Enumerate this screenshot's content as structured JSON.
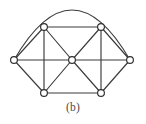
{
  "figure": {
    "caption": "(b)",
    "type": "undirected-graph-diagram",
    "canvas": {
      "width": 146,
      "height": 124
    },
    "colors": {
      "background": "#ffffff",
      "edge_stroke": "#3b3b3b",
      "vertex_stroke": "#2e2e2e",
      "vertex_fill": "#ffffff",
      "caption_text": "#4a4a4a"
    },
    "style": {
      "edge_stroke_width": 1.15,
      "vertex_radius": 3.4
    },
    "vertices": [
      {
        "id": "v-left",
        "label": "",
        "x": 14,
        "y": 60
      },
      {
        "id": "v-top-left",
        "label": "",
        "x": 44,
        "y": 27
      },
      {
        "id": "v-top-right",
        "label": "",
        "x": 101,
        "y": 27
      },
      {
        "id": "v-right",
        "label": "",
        "x": 130,
        "y": 60
      },
      {
        "id": "v-bottom-left",
        "label": "",
        "x": 44,
        "y": 93
      },
      {
        "id": "v-bottom-right",
        "label": "",
        "x": 101,
        "y": 93
      },
      {
        "id": "v-center",
        "label": "",
        "x": 72,
        "y": 60
      }
    ],
    "edges": [
      {
        "id": "e-left-topleft",
        "from": "v-left",
        "to": "v-top-left",
        "shape": "line"
      },
      {
        "id": "e-left-center",
        "from": "v-left",
        "to": "v-center",
        "shape": "line"
      },
      {
        "id": "e-left-bottomleft",
        "from": "v-left",
        "to": "v-bottom-left",
        "shape": "line"
      },
      {
        "id": "e-topleft-topright",
        "from": "v-top-left",
        "to": "v-top-right",
        "shape": "line"
      },
      {
        "id": "e-topleft-center",
        "from": "v-top-left",
        "to": "v-center",
        "shape": "line"
      },
      {
        "id": "e-topleft-bottomleft",
        "from": "v-top-left",
        "to": "v-bottom-left",
        "shape": "line"
      },
      {
        "id": "e-topright-center",
        "from": "v-top-right",
        "to": "v-center",
        "shape": "line"
      },
      {
        "id": "e-topright-right",
        "from": "v-top-right",
        "to": "v-right",
        "shape": "line"
      },
      {
        "id": "e-topright-bottomright",
        "from": "v-top-right",
        "to": "v-bottom-right",
        "shape": "line"
      },
      {
        "id": "e-right-center",
        "from": "v-right",
        "to": "v-center",
        "shape": "line"
      },
      {
        "id": "e-right-bottomright",
        "from": "v-right",
        "to": "v-bottom-right",
        "shape": "line"
      },
      {
        "id": "e-center-bottomleft",
        "from": "v-center",
        "to": "v-bottom-left",
        "shape": "line"
      },
      {
        "id": "e-center-bottomright",
        "from": "v-center",
        "to": "v-bottom-right",
        "shape": "line"
      },
      {
        "id": "e-bottomleft-bottomright",
        "from": "v-bottom-left",
        "to": "v-bottom-right",
        "shape": "line"
      },
      {
        "id": "e-left-right-arc",
        "from": "v-left",
        "to": "v-right",
        "shape": "arc",
        "apex_y": 10
      }
    ],
    "counts": {
      "vertices": 7,
      "edges": 15
    }
  }
}
